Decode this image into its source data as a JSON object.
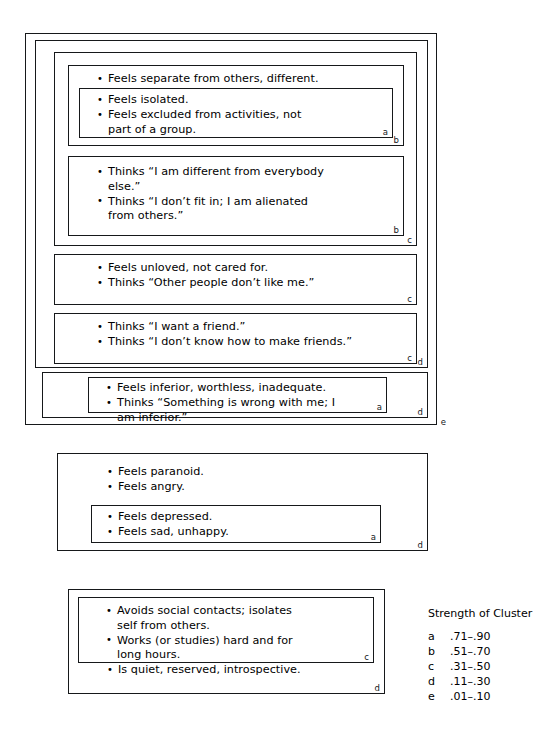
{
  "diagram": {
    "groups": [
      {
        "id": "group-1",
        "outer_tag": "e",
        "boxes": [
          {
            "id": "g1-d-outer",
            "tag": "d",
            "items": []
          },
          {
            "id": "g1-c-top",
            "tag": "c",
            "items": []
          },
          {
            "id": "g1-b-top",
            "tag": "b",
            "items": [
              "Feels separate from others, different."
            ]
          },
          {
            "id": "g1-a-top",
            "tag": "a",
            "items": [
              "Feels isolated.",
              "Feels excluded from activities, not\npart of a group."
            ]
          },
          {
            "id": "g1-b-second",
            "tag": "b",
            "items": [
              "Thinks “I am different from everybody\nelse.”",
              "Thinks “I don’t fit in; I am alienated\nfrom others.”"
            ]
          },
          {
            "id": "g1-c-third",
            "tag": "c",
            "items": [
              "Feels unloved, not cared for.",
              "Thinks “Other people don’t like me.”"
            ]
          },
          {
            "id": "g1-c-fourth",
            "tag": "c",
            "items": [
              "Thinks “I want a friend.”",
              "Thinks “I don’t know how to make friends.”"
            ]
          },
          {
            "id": "g1-d-bottom",
            "tag": "d",
            "items": []
          },
          {
            "id": "g1-a-bottom",
            "tag": "a",
            "items": [
              "Feels inferior, worthless, inadequate.",
              "Thinks “Something is wrong with me; I\nam inferior.”"
            ]
          }
        ]
      },
      {
        "id": "group-2",
        "boxes": [
          {
            "id": "g2-d",
            "tag": "d",
            "items": [
              "Feels paranoid.",
              "Feels angry."
            ]
          },
          {
            "id": "g2-a",
            "tag": "a",
            "items": [
              "Feels depressed.",
              "Feels sad, unhappy."
            ]
          }
        ]
      },
      {
        "id": "group-3",
        "boxes": [
          {
            "id": "g3-d",
            "tag": "d",
            "items": [
              "Is quiet, reserved, introspective."
            ]
          },
          {
            "id": "g3-c",
            "tag": "c",
            "items": [
              "Avoids social contacts; isolates\nself from others.",
              "Works (or studies) hard and for\nlong hours."
            ]
          }
        ]
      }
    ]
  },
  "legend": {
    "title": "Strength of Cluster",
    "rows": [
      {
        "letter": "a",
        "range": ".71–.90"
      },
      {
        "letter": "b",
        "range": ".51–.70"
      },
      {
        "letter": "c",
        "range": ".31–.50"
      },
      {
        "letter": "d",
        "range": ".11–.30"
      },
      {
        "letter": "e",
        "range": ".01–.10"
      }
    ]
  }
}
